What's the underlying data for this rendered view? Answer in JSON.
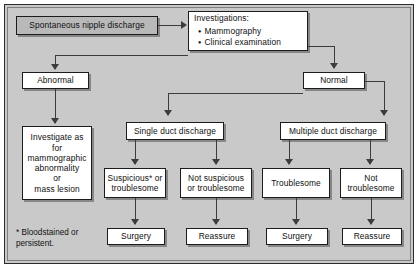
{
  "colors": {
    "canvas": "#c9c9c9",
    "box_fill": "#ffffff",
    "box_fill_grey": "#b9b9b9",
    "border": "#1c1c1c",
    "connector": "#3c3c3c"
  },
  "nodes": {
    "start": "Spontaneous nipple discharge",
    "investigations": {
      "header": "Investigations:",
      "items": [
        "Mammography",
        "Clinical examination"
      ]
    },
    "abnormal": "Abnormal",
    "normal": "Normal",
    "investigate_as": "Investigate as\nfor\nmammographic\nabnormality\nor\nmass lesion",
    "single_duct": "Single duct discharge",
    "multiple_duct": "Multiple duct discharge",
    "suspicious": "Suspicious* or\ntroublesome",
    "not_suspicious": "Not suspicious\nor troublesome",
    "troublesome": "Troublesome",
    "not_troublesome": "Not\ntroublesome",
    "surgery_1": "Surgery",
    "reassure_1": "Reassure",
    "surgery_2": "Surgery",
    "reassure_2": "Reassure"
  },
  "footnote": "* Bloodstained or\npersistent."
}
